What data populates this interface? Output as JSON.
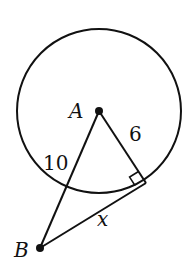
{
  "diagram": {
    "type": "geometry-circle-tangent",
    "circle": {
      "center_label": "A",
      "cx": 99,
      "cy": 111,
      "r": 82
    },
    "points": {
      "A": {
        "label": "A",
        "x": 99,
        "y": 111
      },
      "B": {
        "label": "B",
        "x": 40,
        "y": 248
      },
      "T": {
        "x": 146,
        "y": 183
      }
    },
    "labels": {
      "radius": "6",
      "secant_outside": "10",
      "tangent": "x"
    },
    "colors": {
      "stroke": "#111111",
      "background": "#ffffff"
    }
  }
}
